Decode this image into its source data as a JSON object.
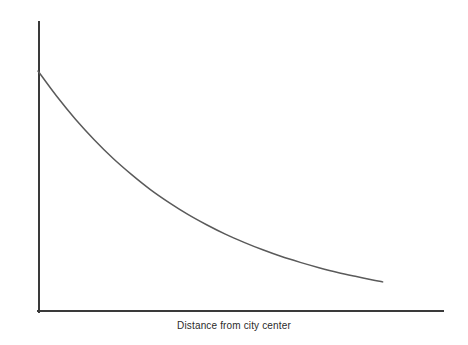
{
  "chart_data": {
    "type": "line",
    "title": "",
    "subtitle": "",
    "xlabel": "Distance from city center",
    "ylabel": "Price of land per square meter",
    "x_tick_labels": [],
    "y_tick_labels": [],
    "grid": false,
    "legend": false,
    "legend_position": "none",
    "xlim": [
      0,
      1
    ],
    "ylim": [
      0,
      1
    ],
    "annotations": [],
    "series": [
      {
        "name": "Land price bid-rent curve",
        "color": "#5a5a5a",
        "line_width": 1.5,
        "x": [
          0.0,
          0.05,
          0.1,
          0.15,
          0.2,
          0.25,
          0.3,
          0.35,
          0.4,
          0.45,
          0.5,
          0.55,
          0.6,
          0.65,
          0.7,
          0.75,
          0.8,
          0.85,
          0.9,
          0.92
        ],
        "y": [
          1.0,
          0.895,
          0.8,
          0.715,
          0.638,
          0.57,
          0.508,
          0.454,
          0.405,
          0.362,
          0.323,
          0.289,
          0.258,
          0.23,
          0.206,
          0.184,
          0.164,
          0.147,
          0.131,
          0.125
        ]
      }
    ]
  },
  "axes": {
    "axis_color": "#3a3a3a",
    "axis_width": 2,
    "y_axis_top_px": 22,
    "origin_px": [
      38,
      312
    ],
    "x_axis_right_px": 443
  },
  "colors": {
    "background": "#ffffff",
    "curve": "#5a5a5a",
    "axis": "#3a3a3a",
    "text": "#2b2b2b"
  }
}
